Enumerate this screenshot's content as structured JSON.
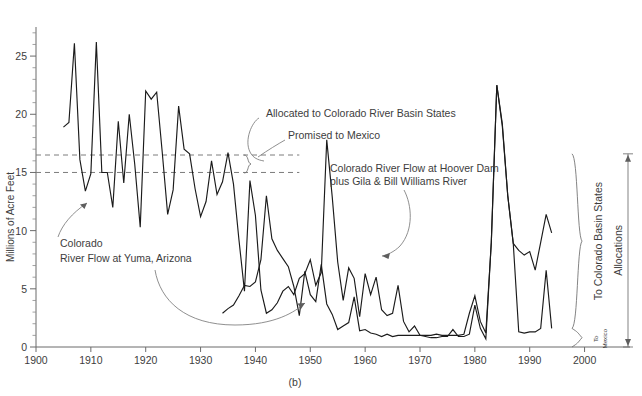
{
  "figure": {
    "caption": "(b)",
    "ylabel": "Millions of Acre Feet"
  },
  "annotations": {
    "allocated": "Allocated to Colorado River Basin States",
    "promised": "Promised to Mexico",
    "hoover_line1": "Colorado River Flow at Hoover Dam",
    "hoover_line2": "plus Gila & Bill Williams River",
    "yuma_line1": "Colorado",
    "yuma_line2": "River Flow at Yuma, Arizona",
    "brace_basin": "To Colorado Basin States",
    "brace_mexico_line1": "To",
    "brace_mexico_line2": "Mexico",
    "brace_allocations": "Allocations"
  },
  "chart_data": {
    "type": "line",
    "title": "",
    "xlabel": "",
    "ylabel": "Millions of Acre Feet",
    "xlim": [
      1900,
      2005
    ],
    "ylim": [
      0,
      27.5
    ],
    "xticks": [
      1900,
      1910,
      1920,
      1930,
      1940,
      1950,
      1960,
      1970,
      1980,
      1990,
      2000
    ],
    "yticks": [
      0,
      5,
      10,
      15,
      20,
      25
    ],
    "ytick_minor_step": 1,
    "grid": false,
    "legend": "none",
    "reference_lines": [
      {
        "label": "Allocated to Colorado River Basin States",
        "value": 16.5,
        "style": "dashed"
      },
      {
        "label": "Promised to Mexico",
        "value": 15.0,
        "style": "dashed"
      }
    ],
    "series": [
      {
        "name": "Colorado River Flow at Yuma, Arizona",
        "x": [
          1905,
          1906,
          1907,
          1908,
          1909,
          1910,
          1911,
          1912,
          1913,
          1914,
          1915,
          1916,
          1917,
          1918,
          1919,
          1920,
          1921,
          1922,
          1923,
          1924,
          1925,
          1926,
          1927,
          1928,
          1929,
          1930,
          1931,
          1932,
          1933,
          1934,
          1935,
          1936,
          1937,
          1938,
          1939,
          1940,
          1941,
          1942,
          1943,
          1944,
          1945,
          1946,
          1947,
          1948,
          1949,
          1950,
          1951,
          1952,
          1953,
          1954,
          1955,
          1956,
          1957,
          1958,
          1959,
          1960,
          1961,
          1962,
          1963,
          1964,
          1965,
          1966,
          1967,
          1968,
          1969,
          1970,
          1971,
          1972,
          1973,
          1974,
          1975,
          1976,
          1977,
          1978,
          1979,
          1980,
          1981,
          1982,
          1983,
          1984,
          1985,
          1986,
          1987,
          1988,
          1989,
          1990,
          1991,
          1992,
          1993,
          1994
        ],
        "values": [
          18.9,
          19.3,
          26.1,
          16.1,
          13.4,
          14.9,
          26.2,
          15.0,
          15.0,
          12.0,
          19.4,
          14.1,
          20.0,
          15.7,
          10.3,
          22.0,
          21.3,
          21.9,
          16.8,
          11.4,
          13.5,
          20.7,
          17.0,
          16.6,
          13.6,
          11.2,
          12.5,
          16.0,
          13.1,
          14.2,
          16.7,
          14.0,
          9.2,
          4.8,
          14.3,
          11.3,
          4.9,
          2.9,
          3.2,
          3.8,
          4.8,
          5.2,
          4.5,
          5.9,
          6.3,
          7.5,
          5.3,
          6.4,
          17.8,
          12.9,
          7.3,
          4.0,
          6.8,
          5.9,
          2.6,
          6.3,
          4.5,
          6.0,
          3.2,
          2.7,
          2.9,
          5.3,
          2.2,
          1.3,
          1.8,
          1.0,
          0.9,
          0.8,
          0.8,
          0.9,
          0.9,
          1.5,
          0.9,
          0.9,
          1.1,
          3.6,
          1.6,
          0.7,
          9.0,
          22.5,
          19.0,
          13.0,
          8.9,
          8.3,
          7.9,
          8.2,
          6.6,
          9.0,
          11.4,
          9.8
        ]
      },
      {
        "name": "Colorado River Flow at Hoover Dam plus Gila & Bill Williams River",
        "x": [
          1934,
          1935,
          1936,
          1937,
          1938,
          1939,
          1940,
          1941,
          1942,
          1943,
          1944,
          1945,
          1946,
          1947,
          1948,
          1949,
          1950,
          1951,
          1952,
          1953,
          1954,
          1955,
          1956,
          1957,
          1958,
          1959,
          1960,
          1961,
          1962,
          1963,
          1964,
          1965,
          1966,
          1967,
          1968,
          1969,
          1970,
          1971,
          1972,
          1973,
          1974,
          1975,
          1976,
          1977,
          1978,
          1979,
          1980,
          1981,
          1982,
          1983,
          1984,
          1985,
          1986,
          1987,
          1988,
          1989,
          1990,
          1991,
          1992,
          1993,
          1994
        ],
        "values": [
          2.9,
          3.3,
          3.6,
          4.4,
          5.3,
          5.2,
          5.6,
          7.5,
          13.0,
          9.3,
          8.3,
          7.6,
          6.9,
          5.2,
          2.7,
          6.5,
          4.5,
          3.9,
          7.1,
          3.7,
          2.8,
          1.5,
          1.8,
          2.1,
          4.3,
          1.4,
          1.5,
          1.2,
          1.1,
          0.9,
          1.1,
          0.9,
          1.0,
          1.0,
          1.0,
          1.0,
          1.0,
          1.0,
          1.0,
          1.1,
          1.0,
          1.0,
          1.0,
          1.0,
          1.1,
          2.9,
          4.4,
          2.2,
          1.2,
          9.0,
          22.5,
          19.2,
          13.0,
          8.9,
          1.3,
          1.2,
          1.3,
          1.3,
          1.6,
          6.6,
          1.6
        ]
      }
    ],
    "brace_labels": {
      "To Colorado Basin States": {
        "from": 1.6,
        "to": 16.6
      },
      "To Mexico": {
        "from": 0.0,
        "to": 1.6
      },
      "Allocations": {
        "from": 0.0,
        "to": 16.6
      }
    }
  }
}
